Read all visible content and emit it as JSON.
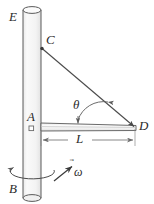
{
  "figure": {
    "type": "mechanics-free-body-diagram",
    "background_color": "#ffffff",
    "ink_color": "#4a4a4a",
    "label_color": "#2b2b2b",
    "fill_color": "#f2f2f2"
  },
  "labels": {
    "E": "E",
    "C": "C",
    "A": "A",
    "B": "B",
    "D": "D",
    "theta": "θ",
    "L": "L",
    "omega": "ω",
    "omega_accent": "⃗"
  },
  "geometry": {
    "vertical_rod": {
      "name": "rod-EB",
      "x_left": 23,
      "x_right": 41,
      "y_top": 10,
      "y_bottom": 198,
      "ellipse_rx": 9,
      "ellipse_ry": 3.5
    },
    "horizontal_rod": {
      "name": "rod-AD",
      "x_left": 41,
      "x_right": 136,
      "y_top": 123,
      "y_bottom": 131
    },
    "cable_CD": {
      "name": "cable-CD",
      "x1": 41,
      "y1": 48,
      "x2": 135,
      "y2": 127
    },
    "point_C": {
      "x": 41,
      "y": 48
    },
    "point_D": {
      "x": 135,
      "y": 127
    },
    "point_A_marker": {
      "x": 31,
      "y": 128,
      "size": 4
    },
    "dimension_L": {
      "y": 140,
      "x_start": 41,
      "x_end": 135
    },
    "angle_arc": {
      "center_x": 100,
      "center_y": 124,
      "radius": 26,
      "label_x": 76,
      "label_y": 100
    },
    "spin_arc": {
      "cx": 32,
      "cy": 172,
      "rx": 22,
      "ry": 7
    },
    "omega_arrow": {
      "x1": 55,
      "y1": 180,
      "x2": 73,
      "y2": 167
    }
  },
  "label_positions": {
    "E": {
      "x": 9,
      "y": 10
    },
    "C": {
      "x": 46,
      "y": 33
    },
    "A": {
      "x": 27,
      "y": 110
    },
    "B": {
      "x": 9,
      "y": 182
    },
    "D": {
      "x": 139,
      "y": 120
    },
    "theta": {
      "x": 74,
      "y": 99
    },
    "L": {
      "x": 76,
      "y": 133
    },
    "omega": {
      "x": 74,
      "y": 164
    }
  }
}
